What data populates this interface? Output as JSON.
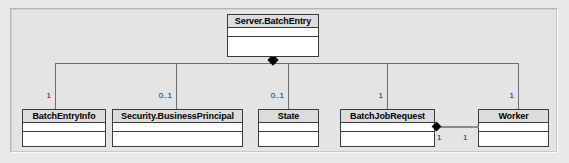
{
  "diagram": {
    "type": "uml-class-diagram",
    "title": "",
    "background_color": "#e9e9e9",
    "frame_color": "#b5b5b5",
    "line_color": "#6e6e6e",
    "class_header_color": "#dcdcdc",
    "class_body_color": "#ffffff",
    "class_border_color": "#3b3b3b",
    "parent": {
      "name": "Server.BatchEntry",
      "compartments": [
        "",
        ""
      ]
    },
    "children": [
      {
        "name": "BatchEntryInfo",
        "multiplicity": "1"
      },
      {
        "name": "Security.BusinessPrincipal",
        "multiplicity": "0..1"
      },
      {
        "name": "State",
        "multiplicity": "0..1"
      },
      {
        "name": "BatchJobRequest",
        "multiplicity": "1"
      },
      {
        "name": "Worker",
        "multiplicity": "1"
      }
    ],
    "side_association": {
      "source": "BatchJobRequest",
      "target": "Worker",
      "source_multiplicity": "1",
      "target_multiplicity": "1",
      "kind": "composition"
    },
    "relationship_kind": "composition",
    "diamond_glyph": "filled-diamond"
  }
}
